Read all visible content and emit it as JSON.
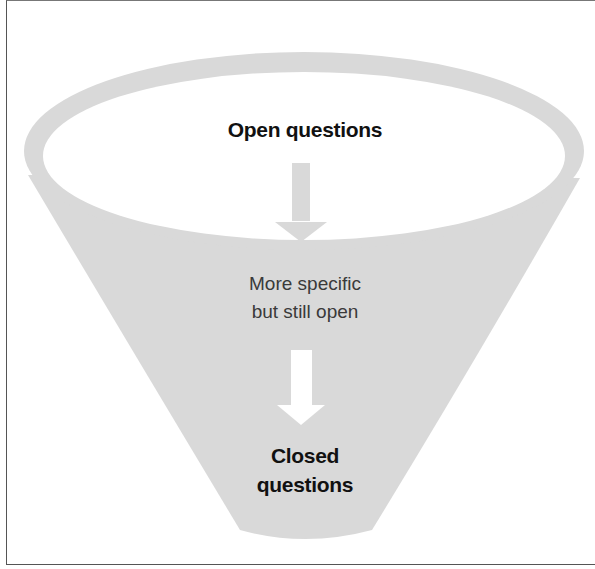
{
  "diagram": {
    "type": "funnel",
    "colors": {
      "funnel_fill": "#d9d9d9",
      "inner_fill": "#ffffff",
      "frame": "#555555",
      "text": "#111111"
    },
    "stages": [
      {
        "label": "Open questions",
        "style": "bold"
      },
      {
        "label_line1": "More specific",
        "label_line2": "but still open",
        "style": "light"
      },
      {
        "label_line1": "Closed",
        "label_line2": "questions",
        "style": "bold"
      }
    ],
    "arrows": [
      {
        "name": "arrow-down-gray",
        "from": "Open questions",
        "to": "More specific but still open"
      },
      {
        "name": "arrow-down-white",
        "from": "More specific but still open",
        "to": "Closed questions"
      }
    ]
  }
}
